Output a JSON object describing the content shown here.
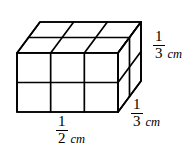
{
  "figure": {
    "name": "rectangular-prism-unit-cubes",
    "background_color": "#ffffff",
    "line_color": "#000000",
    "projection": "oblique",
    "cube_counts": {
      "width_cubes": 3,
      "height_cubes": 2,
      "depth_cubes": 2,
      "total_cubes": 12
    },
    "geometry": {
      "front_left_x": 17,
      "front_right_x": 118,
      "front_top_y": 53,
      "front_bottom_y": 112,
      "depth_dx": 23,
      "depth_dy": -31
    }
  },
  "labels": {
    "width": {
      "numerator": "1",
      "denominator": "2",
      "unit": "cm",
      "edge": "width"
    },
    "height": {
      "numerator": "1",
      "denominator": "3",
      "unit": "cm",
      "edge": "height"
    },
    "depth": {
      "numerator": "1",
      "denominator": "3",
      "unit": "cm",
      "edge": "depth"
    }
  }
}
